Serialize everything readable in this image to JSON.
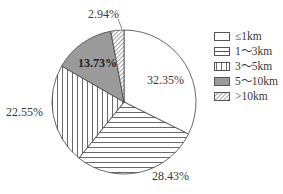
{
  "chart_data": {
    "type": "pie",
    "title": "",
    "categories": [
      "≤1km",
      "1～3km",
      "3～5km",
      "5～10km",
      ">10km"
    ],
    "values": [
      32.35,
      28.43,
      22.55,
      13.73,
      2.94
    ],
    "value_labels": [
      "32.35%",
      "28.43%",
      "22.55%",
      "13.73%",
      "2.94%"
    ],
    "units": "%",
    "start_angle": "12 o'clock",
    "direction": "clockwise",
    "fills": [
      "white",
      "horizontal-lines",
      "vertical-lines",
      "gray",
      "diagonal-hatch"
    ],
    "legend_position": "right"
  },
  "labels": {
    "s0": "32.35%",
    "s1": "28.43%",
    "s2": "22.55%",
    "s3": "13.73%",
    "s4": "2.94%"
  },
  "legend": [
    {
      "label": "≤1km"
    },
    {
      "label": "1～3km"
    },
    {
      "label": "3～5km"
    },
    {
      "label": "5～10km"
    },
    {
      "label": ">10km"
    }
  ]
}
